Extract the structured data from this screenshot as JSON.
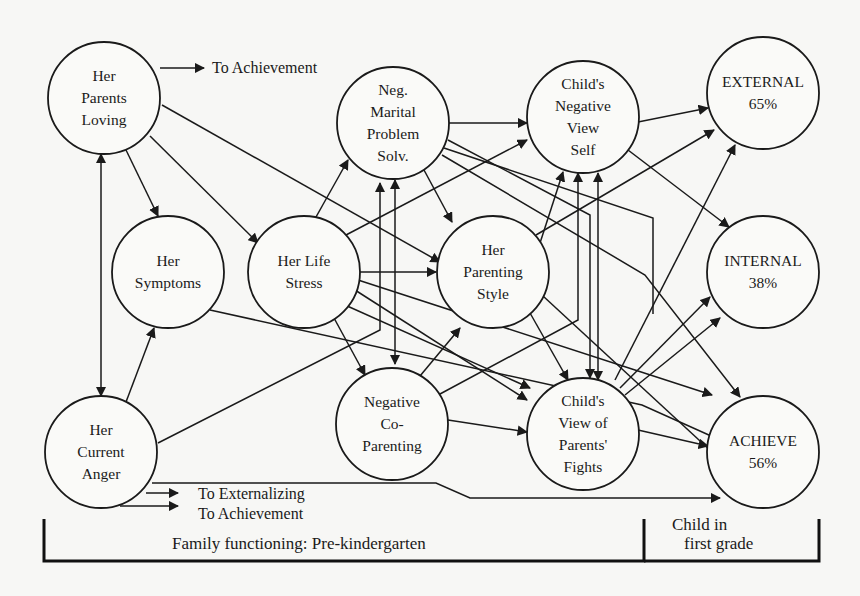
{
  "diagram": {
    "nodes": [
      {
        "id": "her_parents_loving",
        "lines": [
          "Her",
          "Parents",
          "Loving"
        ],
        "cx": 104,
        "cy": 98,
        "r": 56
      },
      {
        "id": "neg_marital",
        "lines": [
          "Neg.",
          "Marital",
          "Problem",
          "Solv."
        ],
        "cx": 393,
        "cy": 123,
        "r": 56
      },
      {
        "id": "child_neg_view_self",
        "lines": [
          "Child's",
          "Negative",
          "View",
          "Self"
        ],
        "cx": 583,
        "cy": 117,
        "r": 56
      },
      {
        "id": "external",
        "lines": [
          "EXTERNAL",
          "65%"
        ],
        "cx": 763,
        "cy": 93,
        "r": 56
      },
      {
        "id": "her_symptoms",
        "lines": [
          "Her",
          "Symptoms"
        ],
        "cx": 168,
        "cy": 272,
        "r": 56
      },
      {
        "id": "her_life_stress",
        "lines": [
          "Her Life",
          "Stress"
        ],
        "cx": 304,
        "cy": 272,
        "r": 56
      },
      {
        "id": "her_parenting_style",
        "lines": [
          "Her",
          "Parenting",
          "Style"
        ],
        "cx": 493,
        "cy": 272,
        "r": 56
      },
      {
        "id": "internal",
        "lines": [
          "INTERNAL",
          "38%"
        ],
        "cx": 763,
        "cy": 272,
        "r": 56
      },
      {
        "id": "her_current_anger",
        "lines": [
          "Her",
          "Current",
          "Anger"
        ],
        "cx": 101,
        "cy": 452,
        "r": 56
      },
      {
        "id": "neg_coparenting",
        "lines": [
          "Negative",
          "Co-",
          "Parenting"
        ],
        "cx": 392,
        "cy": 424,
        "r": 56
      },
      {
        "id": "child_view_fights",
        "lines": [
          "Child's",
          "View of",
          "Parents'",
          "Fights"
        ],
        "cx": 583,
        "cy": 434,
        "r": 56
      },
      {
        "id": "achieve",
        "lines": [
          "ACHIEVE",
          "56%"
        ],
        "cx": 763,
        "cy": 452,
        "r": 56
      }
    ],
    "edges": [
      {
        "pts": [
          [
            160,
            68
          ],
          [
            204,
            68
          ]
        ],
        "arrow": true
      },
      {
        "pts": [
          [
            126,
            150
          ],
          [
            158,
            216
          ]
        ],
        "arrow": true
      },
      {
        "pts": [
          [
            150,
            136
          ],
          [
            258,
            243
          ]
        ],
        "arrow": true
      },
      {
        "pts": [
          [
            162,
            105
          ],
          [
            440,
            262
          ]
        ],
        "arrow": true
      },
      {
        "pts": [
          [
            101,
            396
          ],
          [
            101,
            154
          ]
        ],
        "arrow": true,
        "double": true
      },
      {
        "pts": [
          [
            126,
            402
          ],
          [
            154,
            328
          ]
        ],
        "arrow": true
      },
      {
        "pts": [
          [
            158,
            443
          ],
          [
            380,
            330
          ],
          [
            380,
            183
          ]
        ],
        "arrow": true
      },
      {
        "pts": [
          [
            146,
            493
          ],
          [
            178,
            493
          ]
        ],
        "arrow": true
      },
      {
        "pts": [
          [
            120,
            506
          ],
          [
            178,
            506
          ]
        ],
        "arrow": true
      },
      {
        "pts": [
          [
            152,
            483
          ],
          [
            436,
            483
          ],
          [
            470,
            498
          ],
          [
            720,
            498
          ]
        ],
        "arrow": true
      },
      {
        "pts": [
          [
            210,
            310
          ],
          [
            642,
            405
          ],
          [
            720,
            440
          ]
        ],
        "arrow": false
      },
      {
        "pts": [
          [
            316,
            217
          ],
          [
            348,
            160
          ]
        ],
        "arrow": true
      },
      {
        "pts": [
          [
            360,
            272
          ],
          [
            436,
            272
          ]
        ],
        "arrow": true
      },
      {
        "pts": [
          [
            346,
            235
          ],
          [
            527,
            140
          ]
        ],
        "arrow": true
      },
      {
        "pts": [
          [
            334,
            318
          ],
          [
            365,
            375
          ]
        ],
        "arrow": true
      },
      {
        "pts": [
          [
            345,
            305
          ],
          [
            530,
            388
          ]
        ],
        "arrow": true
      },
      {
        "pts": [
          [
            355,
            290
          ],
          [
            527,
            400
          ]
        ],
        "arrow": true
      },
      {
        "pts": [
          [
            358,
            280
          ],
          [
            635,
            370
          ],
          [
            712,
            395
          ]
        ],
        "arrow": true
      },
      {
        "pts": [
          [
            395,
            364
          ],
          [
            395,
            180
          ]
        ],
        "arrow": true,
        "double": true
      },
      {
        "pts": [
          [
            449,
            123
          ],
          [
            527,
            123
          ]
        ],
        "arrow": true
      },
      {
        "pts": [
          [
            444,
            148
          ],
          [
            653,
            218
          ],
          [
            653,
            314
          ]
        ],
        "arrow": false
      },
      {
        "pts": [
          [
            424,
            170
          ],
          [
            452,
            222
          ]
        ],
        "arrow": true
      },
      {
        "pts": [
          [
            448,
            140
          ],
          [
            590,
            215
          ],
          [
            590,
            378
          ]
        ],
        "arrow": true
      },
      {
        "pts": [
          [
            442,
            155
          ],
          [
            645,
            275
          ],
          [
            740,
            397
          ]
        ],
        "arrow": true
      },
      {
        "pts": [
          [
            420,
            376
          ],
          [
            460,
            328
          ]
        ],
        "arrow": true
      },
      {
        "pts": [
          [
            440,
            394
          ],
          [
            578,
            320
          ],
          [
            578,
            173
          ]
        ],
        "arrow": true
      },
      {
        "pts": [
          [
            448,
            420
          ],
          [
            527,
            432
          ]
        ],
        "arrow": true
      },
      {
        "pts": [
          [
            540,
            243
          ],
          [
            563,
            172
          ]
        ],
        "arrow": true
      },
      {
        "pts": [
          [
            536,
            235
          ],
          [
            714,
            130
          ]
        ],
        "arrow": true
      },
      {
        "pts": [
          [
            530,
            313
          ],
          [
            568,
            380
          ]
        ],
        "arrow": true
      },
      {
        "pts": [
          [
            543,
            296
          ],
          [
            712,
            452
          ]
        ],
        "arrow": false
      },
      {
        "pts": [
          [
            598,
            380
          ],
          [
            598,
            173
          ]
        ],
        "arrow": true,
        "double": true
      },
      {
        "pts": [
          [
            638,
            122
          ],
          [
            708,
            108
          ]
        ],
        "arrow": true
      },
      {
        "pts": [
          [
            628,
            150
          ],
          [
            729,
            227
          ]
        ],
        "arrow": true
      },
      {
        "pts": [
          [
            615,
            380
          ],
          [
            735,
            145
          ]
        ],
        "arrow": true
      },
      {
        "pts": [
          [
            620,
            388
          ],
          [
            710,
            297
          ]
        ],
        "arrow": true
      },
      {
        "pts": [
          [
            625,
            395
          ],
          [
            720,
            318
          ]
        ],
        "arrow": true
      },
      {
        "pts": [
          [
            638,
            430
          ],
          [
            708,
            446
          ]
        ],
        "arrow": true
      }
    ],
    "external_labels": [
      {
        "text": "To Achievement",
        "x": 212,
        "y": 73
      },
      {
        "text": "To Externalizing",
        "x": 198,
        "y": 499
      },
      {
        "text": "To Achievement",
        "x": 198,
        "y": 519
      }
    ],
    "bracket": {
      "left_x": 44,
      "divider_x": 644,
      "right_x": 819,
      "top_y": 519,
      "bottom_y": 561,
      "left_label": "Family functioning: Pre-kindergarten",
      "left_label_x": 172,
      "left_label_y": 549,
      "right_label_line1": "Child in",
      "right_label_line2": "first grade",
      "right_label_x": 672,
      "right_label_y1": 530,
      "right_label_y2": 549
    }
  }
}
